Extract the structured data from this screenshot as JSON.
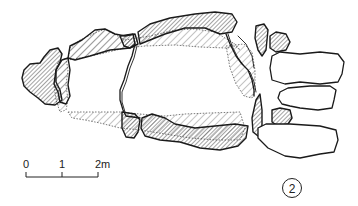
{
  "figure": {
    "figure_number": "2"
  },
  "scale_bar": {
    "ticks": [
      "0",
      "1",
      "2m"
    ]
  },
  "legend_hints": {
    "dense_hatch": "capstone / upright stone",
    "light_hatch": "cover slab outline (dotted edge)",
    "plain": "unhatched kerb stones"
  },
  "colors": {
    "ink": "#222222",
    "paper": "#ffffff"
  }
}
